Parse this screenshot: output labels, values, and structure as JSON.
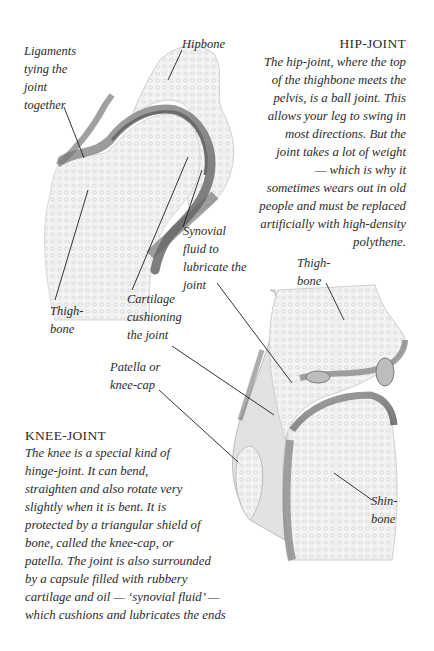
{
  "hip": {
    "heading": "HIP-JOINT",
    "lines": [
      "The hip-joint, where the top",
      "of the thighbone meets the",
      "pelvis, is a ball joint. This",
      "allows your leg to swing in",
      "most directions. But the",
      "joint takes a lot of weight",
      "— which is why it",
      "sometimes wears out in old",
      "people and must be replaced",
      "artificially with high-density",
      "polythene."
    ],
    "labels": {
      "ligaments": "Ligaments\ntying the\njoint\ntogether",
      "hipbone": "Hipbone",
      "thighbone": "Thigh-\nbone",
      "synovial": "Synovial\nfluid to\nlubricate the\njoint",
      "cartilage": "Cartilage\ncushioning\nthe joint"
    }
  },
  "knee": {
    "heading": "KNEE-JOINT",
    "lines": [
      "The knee is a special kind of",
      "hinge-joint. It can bend,",
      "straighten and also rotate very",
      "slightly when it is bent. It is",
      "protected by a triangular shield of",
      "bone, called the knee-cap, or",
      "patella. The joint is also surrounded",
      "by a capsule filled with rubbery",
      "cartilage and oil — ‘synovial fluid’ —",
      "which cushions and lubricates the ends"
    ],
    "labels": {
      "patella": "Patella or\nknee-cap",
      "thighbone": "Thigh-\nbone",
      "shinbone": "Shin-\nbone"
    }
  },
  "colors": {
    "bone_fill": "#f1f1f1",
    "bone_texture": "#d6d6d6",
    "cartilage": "#8a8a8a",
    "cartilage_dark": "#5e5e5e",
    "leader_line": "#1e1e1e"
  }
}
